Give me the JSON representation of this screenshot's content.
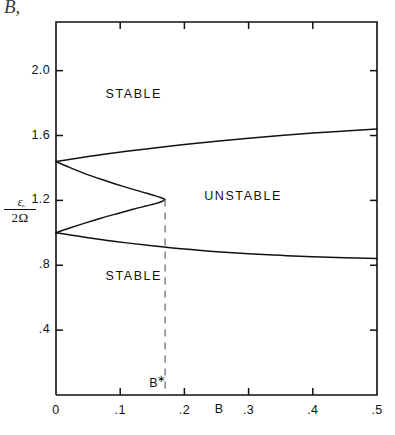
{
  "figure": {
    "top_fragment": "B,",
    "background": "#ffffff",
    "line_color": "#111111",
    "dash_color": "#8a8a8a"
  },
  "axes": {
    "y_title_numerator": "ε",
    "y_title_denominator": "2",
    "y_title_symbol": "Ω",
    "y_title_hat": "ˆ",
    "x_axis_label": "B",
    "y_ticks": [
      ".4",
      ".8",
      "1.2",
      "1.6",
      "2.0"
    ],
    "x_ticks": [
      "0",
      ".1",
      ".2",
      ".3",
      ".4",
      ".5"
    ]
  },
  "annotations": {
    "stable_upper": "STABLE",
    "unstable": "UNSTABLE",
    "stable_lower": "STABLE",
    "critical_point_label": "B",
    "critical_point_sup": "∗"
  },
  "chart_data": {
    "type": "line",
    "title": "",
    "xlabel": "B",
    "ylabel": "ε / 2Ω̂",
    "xlim": [
      0.0,
      0.5
    ],
    "ylim": [
      0.0,
      2.3
    ],
    "grid": false,
    "legend": "none",
    "x_tick_values": [
      0.0,
      0.1,
      0.2,
      0.3,
      0.4,
      0.5
    ],
    "y_tick_values": [
      0.4,
      0.8,
      1.2,
      1.6,
      2.0
    ],
    "regions": [
      {
        "name": "STABLE",
        "position": [
          0.13,
          1.85
        ]
      },
      {
        "name": "UNSTABLE",
        "position": [
          0.29,
          1.22
        ]
      },
      {
        "name": "STABLE",
        "position": [
          0.13,
          0.73
        ]
      }
    ],
    "critical_point": {
      "label": "B*",
      "x": 0.17,
      "y_top": 1.21
    },
    "series": [
      {
        "name": "upper-branch",
        "comment": "upper stability boundary rising to the right",
        "x": [
          0.0,
          0.025,
          0.05,
          0.08,
          0.11,
          0.15,
          0.2,
          0.25,
          0.3,
          0.35,
          0.4,
          0.45,
          0.5
        ],
        "values": [
          1.44,
          1.455,
          1.47,
          1.487,
          1.503,
          1.522,
          1.545,
          1.565,
          1.583,
          1.6,
          1.615,
          1.628,
          1.64
        ]
      },
      {
        "name": "nose-upper",
        "comment": "inner upper arc of leftward-opening parabola, from y=1.44 at B=0 to tip",
        "x": [
          0.0,
          0.02,
          0.045,
          0.07,
          0.095,
          0.12,
          0.14,
          0.155,
          0.165,
          0.17
        ],
        "values": [
          1.44,
          1.405,
          1.365,
          1.33,
          1.298,
          1.268,
          1.245,
          1.228,
          1.215,
          1.205
        ]
      },
      {
        "name": "nose-lower",
        "comment": "inner lower arc of leftward-opening parabola, from y=1.00 at B=0 to tip",
        "x": [
          0.0,
          0.02,
          0.045,
          0.07,
          0.095,
          0.12,
          0.14,
          0.155,
          0.165,
          0.17
        ],
        "values": [
          1.0,
          1.028,
          1.06,
          1.09,
          1.118,
          1.145,
          1.165,
          1.18,
          1.193,
          1.205
        ]
      },
      {
        "name": "lower-branch",
        "comment": "lower stability boundary falling to the right",
        "x": [
          0.0,
          0.025,
          0.05,
          0.08,
          0.11,
          0.15,
          0.2,
          0.25,
          0.3,
          0.35,
          0.4,
          0.45,
          0.5
        ],
        "values": [
          1.0,
          0.985,
          0.97,
          0.953,
          0.938,
          0.92,
          0.9,
          0.884,
          0.871,
          0.861,
          0.852,
          0.846,
          0.842
        ]
      }
    ],
    "dashed_line": {
      "name": "critical-B-marker",
      "x": 0.17,
      "y_from": 1.205,
      "y_to": 0.0,
      "style": "dashed"
    }
  }
}
